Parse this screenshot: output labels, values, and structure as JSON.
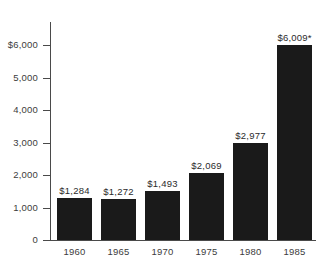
{
  "chart_data": {
    "type": "bar",
    "title": "",
    "subtitle": "",
    "xlabel": "",
    "ylabel": "",
    "categories": [
      "1960",
      "1965",
      "1970",
      "1975",
      "1980",
      "1985"
    ],
    "values": [
      1284,
      1272,
      1493,
      2069,
      2977,
      6009
    ],
    "value_labels": [
      "$1,284",
      "$1,272",
      "$1,493",
      "$2,069",
      "$2,977",
      "$6,009*"
    ],
    "ylim": [
      0,
      6600
    ],
    "yticks": [
      0,
      1000,
      2000,
      3000,
      4000,
      5000,
      6000
    ],
    "ytick_labels": [
      "0",
      "1,000",
      "2,000",
      "3,000",
      "4,000",
      "5,000",
      "$6,000"
    ],
    "grid": false,
    "legend": null,
    "annotations": [
      "* asterisk footnote marker on 1985 value"
    ],
    "colors": {
      "bar": "#1a1a1a",
      "axis": "#4a4a4a",
      "text": "#3c3c3c",
      "background": "#ffffff"
    }
  }
}
